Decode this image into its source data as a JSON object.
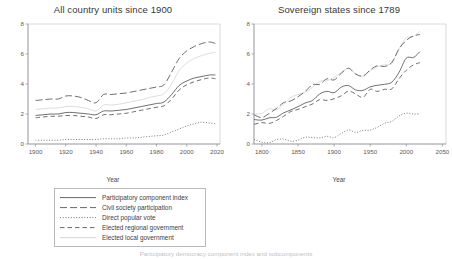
{
  "figure": {
    "caption_partial": "Participatory democracy component index and subcomponents"
  },
  "legend": {
    "entries": [
      {
        "label": "Participatory component index",
        "style": "solid",
        "color": "#4a4a4c"
      },
      {
        "label": "Civil society participation",
        "style": "long-dash",
        "color": "#4a4a4c"
      },
      {
        "label": "Direct popular vote",
        "style": "dotted",
        "color": "#5a5a5c"
      },
      {
        "label": "Elected regional government",
        "style": "dash-dash",
        "color": "#4a4a4c"
      },
      {
        "label": "Elected local government",
        "style": "faint-solid",
        "color": "#d7d7db"
      }
    ]
  },
  "panels": [
    {
      "id": "all-country-units",
      "title": "All country units since 1900",
      "xlabel": "Year",
      "ylabel": ""
    },
    {
      "id": "sovereign-states",
      "title": "Sovereign states since 1789",
      "xlabel": "Year",
      "ylabel": ""
    }
  ],
  "chart_data": [
    {
      "type": "line",
      "title": "All country units since 1900",
      "xlabel": "Year",
      "ylabel": "",
      "xlim": [
        1895,
        2022
      ],
      "ylim": [
        0,
        8
      ],
      "xticks": [
        1900,
        1920,
        1940,
        1960,
        1980,
        2000,
        2020
      ],
      "yticks": [
        0,
        2,
        4,
        6,
        8
      ],
      "grid": false,
      "legend_position": "below",
      "x": [
        1900,
        1905,
        1910,
        1915,
        1920,
        1925,
        1930,
        1935,
        1940,
        1945,
        1950,
        1955,
        1960,
        1965,
        1970,
        1975,
        1980,
        1985,
        1990,
        1995,
        2000,
        2005,
        2010,
        2015,
        2019
      ],
      "series": [
        {
          "name": "Participatory component index",
          "style": "solid",
          "values": [
            1.9,
            1.95,
            2.0,
            2.0,
            2.1,
            2.1,
            2.05,
            2.0,
            1.95,
            2.2,
            2.2,
            2.25,
            2.3,
            2.4,
            2.5,
            2.6,
            2.7,
            2.8,
            3.3,
            3.9,
            4.2,
            4.4,
            4.5,
            4.6,
            4.6
          ]
        },
        {
          "name": "Civil society participation",
          "style": "long-dash",
          "values": [
            2.9,
            2.95,
            3.0,
            3.0,
            3.2,
            3.2,
            3.1,
            2.9,
            2.75,
            3.3,
            3.3,
            3.35,
            3.4,
            3.5,
            3.6,
            3.7,
            3.8,
            3.95,
            4.8,
            5.7,
            6.2,
            6.5,
            6.7,
            6.8,
            6.7
          ]
        },
        {
          "name": "Direct popular vote",
          "style": "dotted",
          "values": [
            0.25,
            0.25,
            0.25,
            0.25,
            0.3,
            0.3,
            0.3,
            0.3,
            0.3,
            0.35,
            0.35,
            0.35,
            0.4,
            0.4,
            0.45,
            0.5,
            0.55,
            0.6,
            0.8,
            1.0,
            1.2,
            1.35,
            1.45,
            1.4,
            1.35
          ]
        },
        {
          "name": "Elected regional government",
          "style": "dash-dash",
          "values": [
            1.75,
            1.8,
            1.85,
            1.85,
            1.9,
            1.9,
            1.85,
            1.8,
            1.7,
            1.95,
            1.95,
            2.0,
            2.05,
            2.15,
            2.25,
            2.35,
            2.45,
            2.55,
            3.0,
            3.6,
            3.95,
            4.15,
            4.3,
            4.4,
            4.35
          ]
        },
        {
          "name": "Elected local government",
          "style": "faint-solid",
          "values": [
            2.3,
            2.35,
            2.4,
            2.4,
            2.5,
            2.5,
            2.45,
            2.35,
            2.2,
            2.6,
            2.6,
            2.65,
            2.75,
            2.85,
            2.95,
            3.1,
            3.2,
            3.35,
            4.0,
            4.9,
            5.4,
            5.7,
            5.9,
            6.05,
            6.1
          ]
        }
      ]
    },
    {
      "type": "line",
      "title": "Sovereign states since 1789",
      "xlabel": "Year",
      "ylabel": "",
      "xlim": [
        1789,
        2055
      ],
      "ylim": [
        0,
        8
      ],
      "xticks": [
        1800,
        1850,
        1900,
        1950,
        2000,
        2050
      ],
      "yticks": [
        0,
        2,
        4,
        6,
        8
      ],
      "grid": false,
      "legend_position": "below",
      "x": [
        1789,
        1800,
        1810,
        1820,
        1830,
        1840,
        1850,
        1860,
        1870,
        1880,
        1890,
        1900,
        1910,
        1920,
        1930,
        1940,
        1950,
        1960,
        1970,
        1980,
        1990,
        2000,
        2010,
        2019
      ],
      "series": [
        {
          "name": "Participatory component index",
          "style": "solid",
          "values": [
            1.5,
            1.6,
            1.7,
            1.85,
            2.1,
            2.4,
            2.6,
            2.8,
            3.0,
            3.2,
            3.4,
            3.5,
            3.7,
            3.9,
            3.7,
            3.5,
            3.9,
            4.0,
            4.1,
            4.2,
            4.9,
            5.6,
            5.9,
            6.0
          ]
        },
        {
          "name": "Civil society participation",
          "style": "long-dash",
          "values": [
            1.8,
            1.9,
            2.1,
            2.3,
            2.7,
            3.0,
            3.3,
            3.5,
            3.8,
            4.0,
            4.2,
            4.4,
            4.7,
            5.0,
            4.7,
            4.4,
            4.9,
            5.1,
            5.2,
            5.4,
            6.2,
            6.9,
            7.2,
            7.3
          ]
        },
        {
          "name": "Direct popular vote",
          "style": "dotted",
          "values": [
            0.2,
            0.2,
            0.2,
            0.2,
            0.25,
            0.25,
            0.3,
            0.3,
            0.35,
            0.35,
            0.4,
            0.55,
            0.7,
            0.85,
            0.9,
            0.9,
            1.0,
            1.1,
            1.25,
            1.45,
            1.8,
            2.0,
            2.1,
            2.0
          ]
        },
        {
          "name": "Elected regional government",
          "style": "dash-dash",
          "values": [
            1.2,
            1.3,
            1.4,
            1.55,
            1.8,
            2.0,
            2.2,
            2.4,
            2.6,
            2.8,
            2.95,
            3.1,
            3.3,
            3.5,
            3.3,
            3.1,
            3.5,
            3.6,
            3.7,
            3.8,
            4.4,
            5.0,
            5.3,
            5.4
          ]
        },
        {
          "name": "Elected local government",
          "style": "faint-solid",
          "values": [
            1.9,
            2.0,
            2.2,
            2.45,
            2.8,
            3.1,
            3.4,
            3.6,
            3.9,
            4.1,
            4.35,
            4.5,
            4.8,
            5.1,
            4.8,
            4.5,
            5.0,
            5.2,
            5.3,
            5.5,
            6.3,
            7.0,
            7.3,
            7.4
          ]
        }
      ]
    }
  ]
}
